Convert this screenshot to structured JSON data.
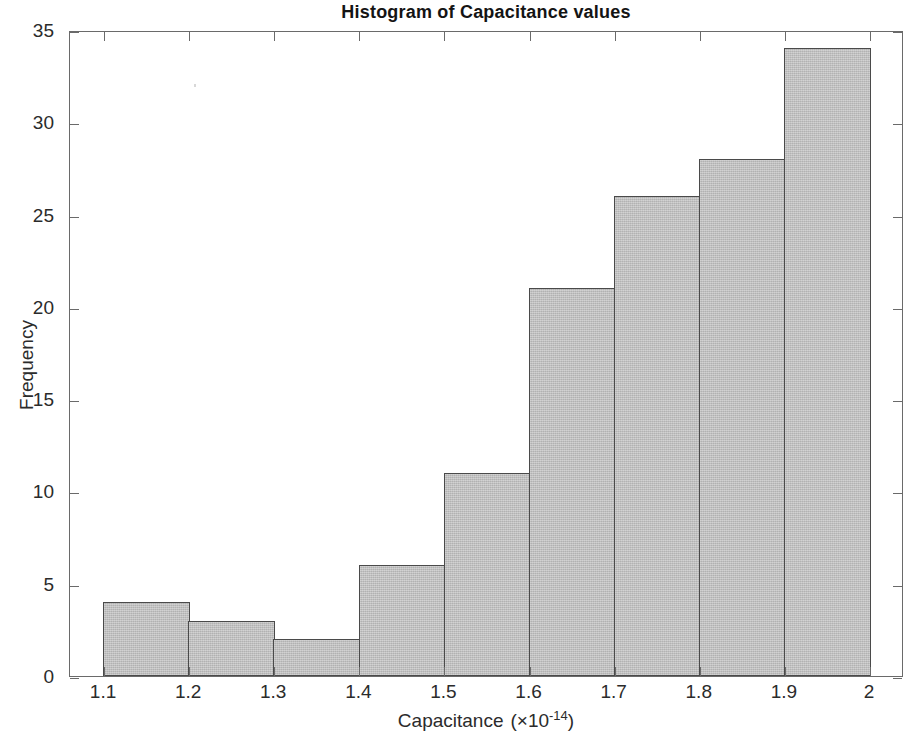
{
  "figure": {
    "title": "Histogram of Capacitance values",
    "background_color": "#ffffff",
    "axis_color": "#6a6a6a",
    "bar_fill_color": "#c3c3c3",
    "bar_edge_color": "#4a4a4a"
  },
  "axes": {
    "y_title": "Frequency",
    "x_title_main": "Capacitance",
    "x_title_unit_prefix": "(×10",
    "x_title_unit_exponent": "-14",
    "x_title_unit_suffix": ")",
    "x_title_full": "Capacitance  (×10-14)",
    "y_ticks": [
      "0",
      "5",
      "10",
      "15",
      "20",
      "25",
      "30",
      "35"
    ],
    "x_ticks": [
      "1.1",
      "1.2",
      "1.3",
      "1.4",
      "1.5",
      "1.6",
      "1.7",
      "1.8",
      "1.9",
      "2"
    ]
  },
  "chart_data": {
    "type": "bar",
    "title": "Histogram of Capacitance values",
    "subtitle": "",
    "xlabel": "Capacitance  (×10-14)",
    "ylabel": "Frequency",
    "categories": [
      "1.1-1.2",
      "1.2-1.3",
      "1.3-1.4",
      "1.4-1.5",
      "1.5-1.6",
      "1.6-1.7",
      "1.7-1.8",
      "1.8-1.9",
      "1.9-2.0"
    ],
    "bin_edges": [
      1.1,
      1.2,
      1.3,
      1.4,
      1.5,
      1.6,
      1.7,
      1.8,
      1.9,
      2.0
    ],
    "values": [
      4,
      3,
      2,
      6,
      11,
      21,
      26,
      28,
      34
    ],
    "bin_width": 0.1,
    "xlim": [
      1.06,
      2.04
    ],
    "ylim": [
      0,
      35
    ],
    "ytick_values": [
      0,
      5,
      10,
      15,
      20,
      25,
      30,
      35
    ],
    "xtick_values": [
      1.1,
      1.2,
      1.3,
      1.4,
      1.5,
      1.6,
      1.7,
      1.8,
      1.9,
      2.0
    ],
    "grid": false,
    "legend": null,
    "total_count": 135,
    "units": "×10^-14 F"
  }
}
